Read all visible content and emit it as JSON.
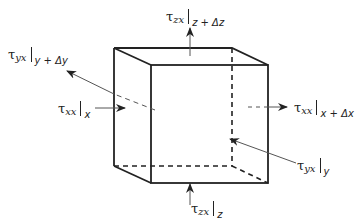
{
  "diagram": {
    "title": "",
    "colors": {
      "edge": "#222222",
      "arrow": "#555555",
      "hidden_edge": "#222222"
    },
    "labels": {
      "top": {
        "symbol": "τ",
        "sub": "zx",
        "eval": "z + Δz"
      },
      "bottom": {
        "symbol": "τ",
        "sub": "zx",
        "eval": "z"
      },
      "left_upper": {
        "symbol": "τ",
        "sub": "yx",
        "eval": "y + Δy"
      },
      "left_lower": {
        "symbol": "τ",
        "sub": "xx",
        "eval": "x"
      },
      "right_middle": {
        "symbol": "τ",
        "sub": "xx",
        "eval": "x + Δx"
      },
      "right_lower": {
        "symbol": "τ",
        "sub": "yx",
        "eval": "y"
      }
    }
  }
}
